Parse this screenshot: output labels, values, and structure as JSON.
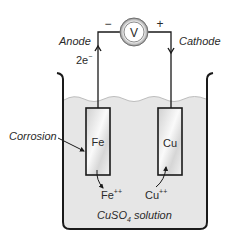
{
  "diagram": {
    "voltmeter": {
      "symbol": "V",
      "negative_sign": "−",
      "positive_sign": "+"
    },
    "anode": {
      "label": "Anode",
      "electron_label": "2e",
      "electron_sup": "−"
    },
    "cathode": {
      "label": "Cathode"
    },
    "electrodes": [
      {
        "label": "Fe",
        "ion_base": "Fe",
        "ion_sup": "++"
      },
      {
        "label": "Cu",
        "ion_base": "Cu",
        "ion_sup": "++"
      }
    ],
    "corrosion_label": "Corrosion",
    "solution": {
      "prefix": "CuSO",
      "sub": "4",
      "suffix": " solution"
    },
    "colors": {
      "line": "#1a1a1a",
      "liquid": "#e6e6e6",
      "liquid_surface": "#bdbdbd",
      "electrode_light": "#f7f7f7",
      "electrode_dark": "#c8c8c8",
      "voltmeter_ring": "#9a9a9a"
    }
  }
}
